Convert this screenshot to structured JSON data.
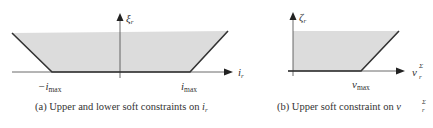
{
  "panels": [
    {
      "id": "a",
      "y_axis_label": "ξ",
      "y_axis_sub": "r",
      "x_axis_label": "i",
      "x_axis_sub": "r",
      "tick_left": "−i",
      "tick_left_sub": "max",
      "tick_right": "i",
      "tick_right_sub": "max",
      "caption_prefix": "(a) Upper and lower soft constraints on ",
      "caption_var": "i",
      "caption_var_sub": "r"
    },
    {
      "id": "b",
      "y_axis_label": "ζ",
      "y_axis_sub": "r",
      "x_axis_label": "v",
      "x_axis_sup": "Σ",
      "x_axis_sub": "r",
      "tick": "v",
      "tick_sub": "max",
      "caption_prefix": "(b) Upper soft constraint on ",
      "caption_var": "v",
      "caption_var_sup": "Σ",
      "caption_var_sub": "r"
    }
  ],
  "colors": {
    "shade": "#dcdcdc",
    "line": "#333333",
    "axis": "#444444"
  }
}
